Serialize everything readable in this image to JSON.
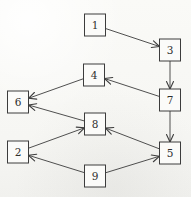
{
  "diagram": {
    "stroke_color": "#3c3c3c",
    "node_fill": "#fbfbf9",
    "background_color": "#f8f8f5",
    "node_width": 21,
    "node_height": 22,
    "nodes": [
      {
        "id": "1",
        "label": "1",
        "x": 95,
        "y": 25
      },
      {
        "id": "3",
        "label": "3",
        "x": 170,
        "y": 50
      },
      {
        "id": "4",
        "label": "4",
        "x": 94,
        "y": 75
      },
      {
        "id": "7",
        "label": "7",
        "x": 170,
        "y": 100
      },
      {
        "id": "6",
        "label": "6",
        "x": 18,
        "y": 102
      },
      {
        "id": "8",
        "label": "8",
        "x": 95,
        "y": 124
      },
      {
        "id": "2",
        "label": "2",
        "x": 18,
        "y": 152
      },
      {
        "id": "5",
        "label": "5",
        "x": 170,
        "y": 153
      },
      {
        "id": "9",
        "label": "9",
        "x": 95,
        "y": 176
      }
    ],
    "edges": [
      {
        "from": "1",
        "to": "3"
      },
      {
        "from": "3",
        "to": "7"
      },
      {
        "from": "7",
        "to": "4"
      },
      {
        "from": "7",
        "to": "5"
      },
      {
        "from": "4",
        "to": "6"
      },
      {
        "from": "8",
        "to": "6"
      },
      {
        "from": "2",
        "to": "8"
      },
      {
        "from": "5",
        "to": "8"
      },
      {
        "from": "9",
        "to": "2"
      },
      {
        "from": "9",
        "to": "5"
      }
    ]
  }
}
